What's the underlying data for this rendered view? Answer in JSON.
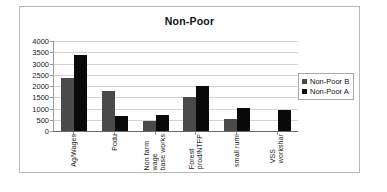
{
  "chart_data": {
    "type": "bar",
    "title": "Non-Poor",
    "xlabel": "",
    "ylabel": "",
    "ylim": [
      0,
      4000
    ],
    "ytick_step": 500,
    "yticks": [
      "0",
      "500",
      "1000",
      "1500",
      "2000",
      "2500",
      "3000",
      "3500",
      "4000"
    ],
    "grid": true,
    "legend_position": "right",
    "categories": [
      "Ag/Wages",
      "Podu",
      "Non farm wage base works",
      "Forest prod/NTFP",
      "small rumi",
      "VSS workshar"
    ],
    "category_lines": [
      [
        "Ag/Wages"
      ],
      [
        "Podu"
      ],
      [
        "Non farm",
        "wage",
        "base works"
      ],
      [
        "Forest",
        "prod/NTFP"
      ],
      [
        "small rumi"
      ],
      [
        "VSS",
        "workshar"
      ]
    ],
    "series": [
      {
        "name": "Non-Poor B",
        "color": "#4a4a4a",
        "values": [
          2350,
          1800,
          430,
          1500,
          520,
          0
        ]
      },
      {
        "name": "Non-Poor A",
        "color": "#0a0a0a",
        "values": [
          3400,
          680,
          690,
          2000,
          1010,
          920
        ]
      }
    ]
  },
  "legend": {
    "items": [
      {
        "label": "Non-Poor B",
        "color": "#4a4a4a"
      },
      {
        "label": "Non-Poor A",
        "color": "#0a0a0a"
      }
    ]
  }
}
